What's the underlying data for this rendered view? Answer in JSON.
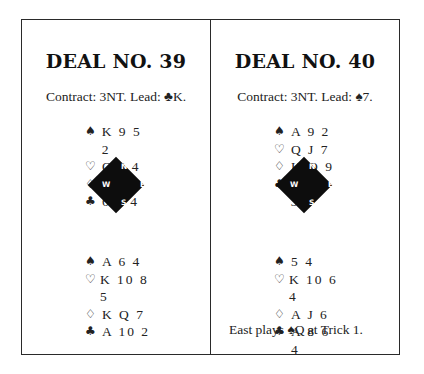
{
  "deals": [
    {
      "title": "DEAL NO. 39",
      "contract": "Contract: 3NT. Lead: ♣K.",
      "north": [
        {
          "suit": "♠",
          "cards": "K 9 5 2"
        },
        {
          "suit": "♡",
          "cards": "Q J 4"
        },
        {
          "suit": "♢",
          "cards": "A J 5"
        },
        {
          "suit": "♣",
          "cards": "6 5 4"
        }
      ],
      "compass": {
        "n": "N",
        "s": "S",
        "e": "E",
        "w": "W"
      },
      "south": [
        {
          "suit": "♠",
          "cards": "A 6 4"
        },
        {
          "suit": "♡",
          "cards": "K 10 8 5"
        },
        {
          "suit": "♢",
          "cards": "K Q 7"
        },
        {
          "suit": "♣",
          "cards": "A 10 2"
        }
      ],
      "note": ""
    },
    {
      "title": "DEAL NO. 40",
      "contract": "Contract: 3NT. Lead: ♠7.",
      "north": [
        {
          "suit": "♠",
          "cards": "A 9 2"
        },
        {
          "suit": "♡",
          "cards": "Q J 7"
        },
        {
          "suit": "♢",
          "cards": "K Q 9"
        },
        {
          "suit": "♣",
          "cards": "K 7 5 3"
        }
      ],
      "compass": {
        "n": "N",
        "s": "S",
        "e": "E",
        "w": "W"
      },
      "south": [
        {
          "suit": "♠",
          "cards": "5 4"
        },
        {
          "suit": "♡",
          "cards": "K 10 6 4"
        },
        {
          "suit": "♢",
          "cards": "A J 6"
        },
        {
          "suit": "♣",
          "cards": "A 8 6 4"
        }
      ],
      "note": "East plays ♠Q at Trick 1."
    }
  ]
}
